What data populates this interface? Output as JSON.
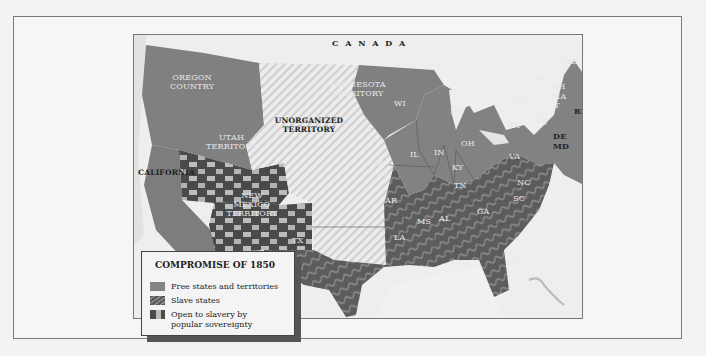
{
  "map": {
    "title": "COMPROMISE OF 1850",
    "colors": {
      "free": "#858585",
      "slave": "#5e5e5e",
      "slave_stripe": "#8a8a8a",
      "popular_sovereignty_dark": "#4a4a4a",
      "popular_sovereignty_light": "#b9b9b9",
      "unorganized": "#e4e4e4",
      "water": "#f0f0f0"
    },
    "labels": {
      "canada": "C A N A D A",
      "oregon": "OREGON COUNTRY",
      "minnesota": "MINNESOTA TERRITORY",
      "unorganized": "UNORGANIZED TERRITORY",
      "utah": "UTAH TERRITORY",
      "new_mexico": "NEW MEXICO TERRITORY",
      "california": "CALIFORNIA",
      "states": {
        "ME": "ME",
        "VT": "VT",
        "NH": "NH",
        "MA": "MA",
        "CT": "CT",
        "RI": "RI",
        "NY": "NY",
        "NJ": "NJ",
        "PA": "PA",
        "DE": "DE",
        "MD": "MD",
        "WI": "WI",
        "MI": "MI",
        "IA": "IA",
        "IL": "IL",
        "IN": "IN",
        "OH": "OH",
        "MO": "MO",
        "KY": "KY",
        "VA": "VA",
        "NC": "NC",
        "TN": "TN",
        "SC": "SC",
        "AR": "AR",
        "MS": "MS",
        "AL": "AL",
        "GA": "GA",
        "LA": "LA",
        "TX": "TX",
        "FL": "FL"
      }
    },
    "legend": {
      "title": "COMPROMISE OF 1850",
      "items": [
        {
          "label": "Free states and territories",
          "type": "free"
        },
        {
          "label": "Slave states",
          "type": "slave"
        },
        {
          "label": "Open to slavery by popular sovereignty",
          "type": "popular"
        }
      ]
    }
  }
}
